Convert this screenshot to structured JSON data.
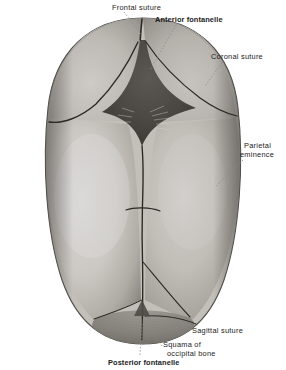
{
  "figure": {
    "background_color": "#ffffff"
  },
  "labels": [
    {
      "id": "frontal-suture",
      "text": "Frontal suture",
      "weight": "regular",
      "x": 112,
      "y": 3
    },
    {
      "id": "anterior-fontanelle",
      "text": "Anterior fontanelle",
      "weight": "bold",
      "x": 155,
      "y": 15
    },
    {
      "id": "coronal-suture",
      "text": "Coronal suture",
      "weight": "regular",
      "x": 211,
      "y": 52
    },
    {
      "id": "parietal-eminence-line1",
      "text": "Parietal",
      "weight": "regular",
      "x": 244,
      "y": 141
    },
    {
      "id": "parietal-eminence-line2",
      "text": "eminence",
      "weight": "regular",
      "x": 240,
      "y": 150
    },
    {
      "id": "sagittal-suture",
      "text": "Sagittal suture",
      "weight": "regular",
      "x": 192,
      "y": 326
    },
    {
      "id": "squama-line1",
      "text": "Squama of",
      "weight": "regular",
      "x": 163,
      "y": 340
    },
    {
      "id": "squama-line2",
      "text": "occipital bone",
      "weight": "regular",
      "x": 167,
      "y": 349
    },
    {
      "id": "posterior-fontanelle",
      "text": "Posterior fontanelle",
      "weight": "bold",
      "x": 108,
      "y": 358
    }
  ],
  "anatomy": {
    "parts": [
      "frontal-bone-left",
      "frontal-bone-right",
      "parietal-bone-left",
      "parietal-bone-right",
      "occipital-squama",
      "anterior-fontanelle",
      "posterior-fontanelle",
      "frontal-suture",
      "coronal-suture",
      "sagittal-suture",
      "lambdoid-suture"
    ]
  },
  "colors": {
    "bone_light": "#f2f0ec",
    "bone_mid": "#cdc9c2",
    "bone_shadow": "#8e8a84",
    "rim_dark": "#5d5a56",
    "suture_line": "#2a2724",
    "fontanelle_dark": "#4a4743",
    "label_text": "#1b1b1b",
    "leader_line": "#8a8a8a"
  }
}
